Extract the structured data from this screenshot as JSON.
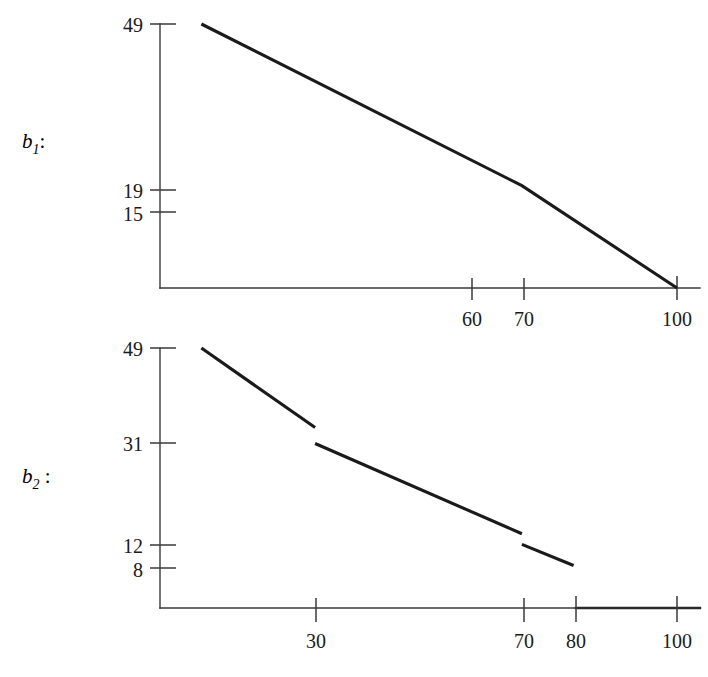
{
  "figure": {
    "background_color": "#ffffff",
    "ink_color": "#1a1a1a"
  },
  "panels": [
    {
      "id": "b1",
      "label_base": "b",
      "label_sub": "1",
      "label_colon": ":",
      "label_full": "b1:"
    },
    {
      "id": "b2",
      "label_base": "b",
      "label_sub": "2",
      "label_colon": " :",
      "label_full": "b2 :"
    }
  ],
  "chart_data": [
    {
      "type": "line",
      "id": "b1-chart",
      "title": "",
      "xlabel": "",
      "ylabel": "b1",
      "xlim": [
        0,
        108
      ],
      "ylim": [
        0,
        56
      ],
      "grid": false,
      "legend": null,
      "xticks": [
        60,
        70,
        100
      ],
      "xtick_labels": [
        "60",
        "70",
        "100"
      ],
      "yticks": [
        49,
        19,
        15
      ],
      "ytick_labels": [
        "49",
        "19",
        "15"
      ],
      "series": [
        {
          "name": "b1",
          "continuous": true,
          "points": [
            {
              "x": 8,
              "y": 49
            },
            {
              "x": 70,
              "y": 19
            },
            {
              "x": 100,
              "y": 0
            }
          ]
        }
      ]
    },
    {
      "type": "line",
      "id": "b2-chart",
      "title": "",
      "xlabel": "",
      "ylabel": "b2",
      "xlim": [
        0,
        108
      ],
      "ylim": [
        0,
        56
      ],
      "grid": false,
      "legend": null,
      "xticks": [
        30,
        70,
        80,
        100
      ],
      "xtick_labels": [
        "30",
        "70",
        "80",
        "100"
      ],
      "yticks": [
        49,
        31,
        12,
        8
      ],
      "ytick_labels": [
        "49",
        "31",
        "12",
        "8"
      ],
      "series": [
        {
          "name": "b2-segment-1",
          "continuous": false,
          "points": [
            {
              "x": 8,
              "y": 49
            },
            {
              "x": 30,
              "y": 34
            }
          ]
        },
        {
          "name": "b2-segment-2",
          "continuous": false,
          "points": [
            {
              "x": 30,
              "y": 31
            },
            {
              "x": 70,
              "y": 14
            }
          ]
        },
        {
          "name": "b2-segment-3",
          "continuous": false,
          "points": [
            {
              "x": 70,
              "y": 12
            },
            {
              "x": 80,
              "y": 8
            }
          ]
        }
      ]
    }
  ]
}
